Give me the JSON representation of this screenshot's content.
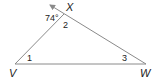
{
  "diagram": {
    "type": "triangle-exterior-angle",
    "colors": {
      "line": "#8a8a8a",
      "text": "#222222",
      "background": "#ffffff"
    },
    "vertices": {
      "V": {
        "label": "V",
        "x": 15,
        "y": 64
      },
      "W": {
        "label": "W",
        "x": 146,
        "y": 64
      },
      "X": {
        "label": "X",
        "x": 64,
        "y": 14
      }
    },
    "angle_labels": {
      "exterior": "74°",
      "angle1": "1",
      "angle2": "2",
      "angle3": "3"
    },
    "ray": {
      "from": "W",
      "through": "X",
      "arrow": true
    }
  }
}
